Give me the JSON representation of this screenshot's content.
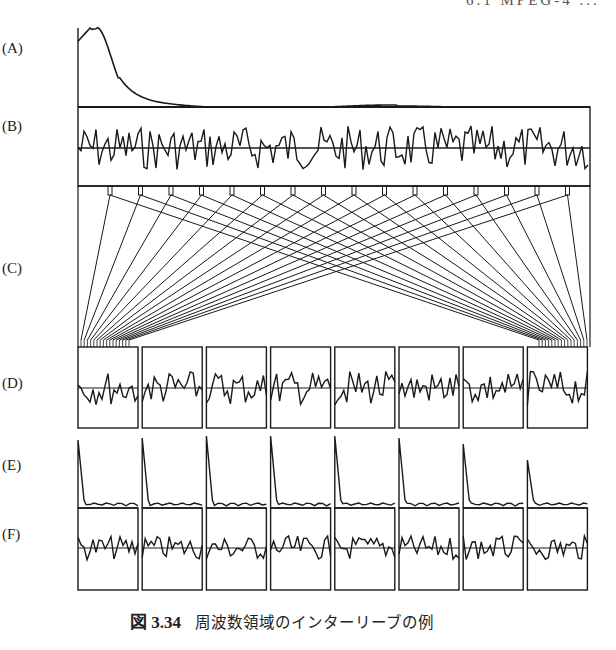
{
  "running_head": "6.1 MPEG-4 ...",
  "figure": {
    "number": "図 3.34",
    "title": "周波数領域のインターリーブの例",
    "rows": [
      {
        "id": "A",
        "label": "(A)",
        "description": "spectral envelope (smooth, peak at low frequency)"
      },
      {
        "id": "B",
        "label": "(B)",
        "description": "flattened MDCT coefficients (full band)"
      },
      {
        "id": "C",
        "label": "(C)",
        "description": "interleaving mapping lines"
      },
      {
        "id": "D",
        "label": "(D)",
        "description": "interleaved sub-blocks (8 boxes)"
      },
      {
        "id": "E",
        "label": "(E)",
        "description": "per-subblock spectral envelopes (8 spikes)"
      },
      {
        "id": "F",
        "label": "(F)",
        "description": "per-subblock flattened coefficients (8 boxes)"
      }
    ],
    "num_subblocks": 8,
    "num_taps": 16
  }
}
